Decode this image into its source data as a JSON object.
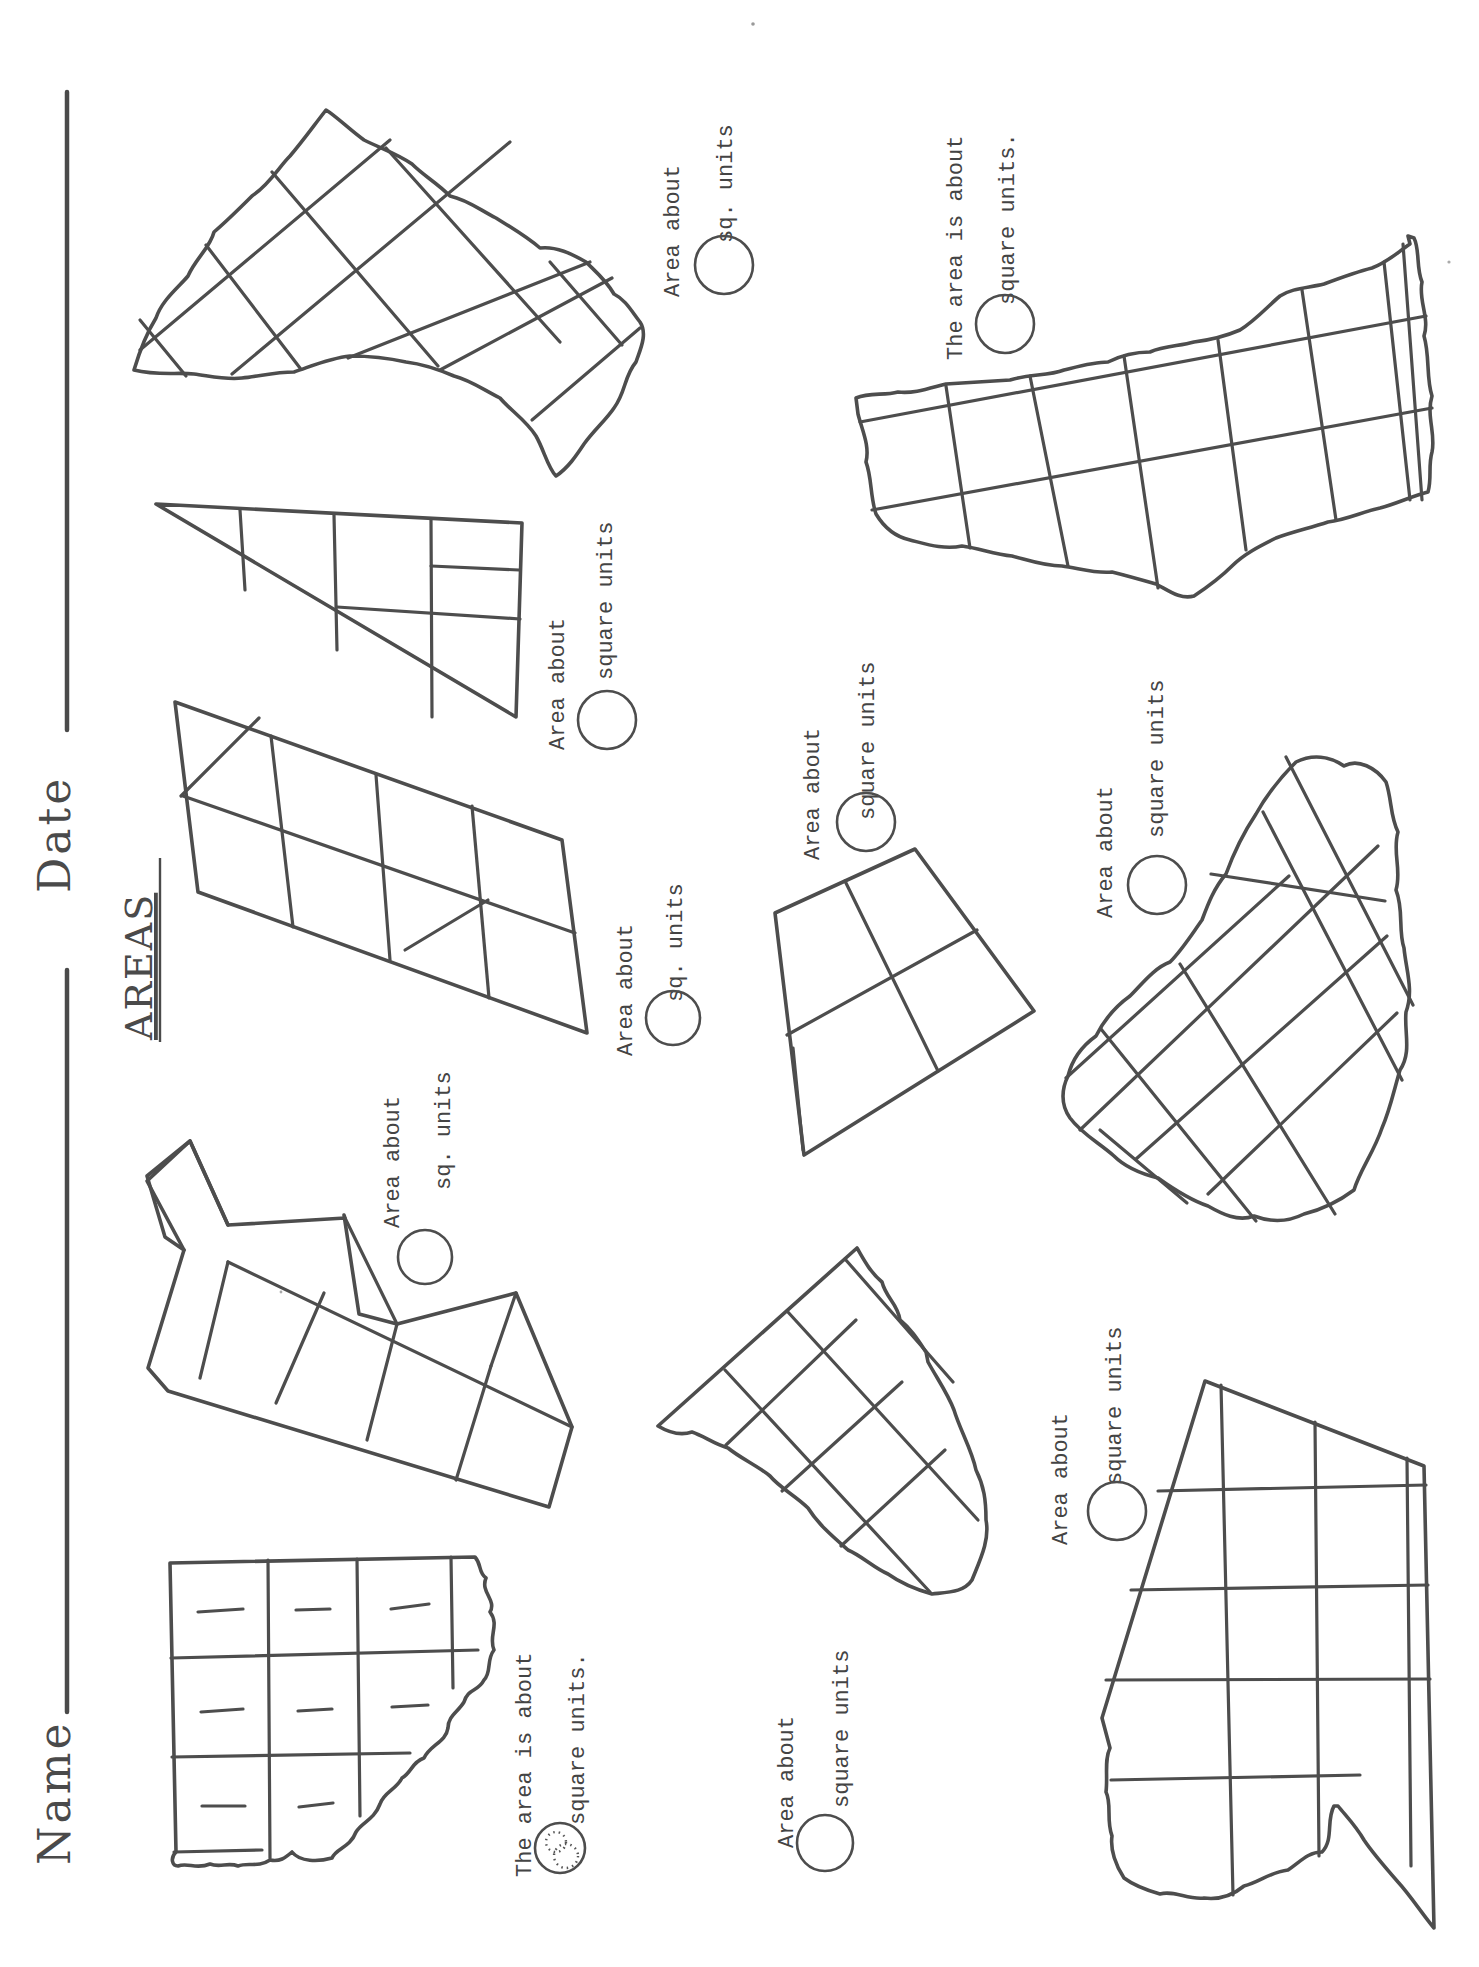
{
  "worksheet": {
    "title": "AREAS",
    "orientation": "rotated 90 degrees counter-clockwise",
    "header": {
      "name_label": "Name",
      "date_label": "Date"
    },
    "ink_color": "#4d4d4d",
    "paper_color": "#ffffff",
    "problems": [
      {
        "id": "example-torn-grid",
        "label_line1": "The area is about",
        "label_line2": "square units.",
        "answer": "8",
        "answer_style": "dotted-traced",
        "grid": "3x4 with torn edge, 8 tally-marked squares"
      },
      {
        "id": "zigzag-strip",
        "label_line1": "Area about",
        "label_line2": "sq. units",
        "answer": ""
      },
      {
        "id": "torn-pentagon",
        "label_line1": "Area about",
        "label_line2": "square units",
        "answer": ""
      },
      {
        "id": "trapezoid-with-notch",
        "label_line1": "Area about",
        "label_line2": "square units",
        "answer": ""
      },
      {
        "id": "parallelogram",
        "label_line1": "Area about",
        "label_line2": "sq. units",
        "answer": ""
      },
      {
        "id": "small-quad",
        "label_line1": "Area about",
        "label_line2": "square units",
        "answer": ""
      },
      {
        "id": "torn-blob-right",
        "label_line1": "Area about",
        "label_line2": "square units",
        "answer": ""
      },
      {
        "id": "right-triangle",
        "label_line1": "Area about",
        "label_line2": "square units",
        "answer": ""
      },
      {
        "id": "torn-triangle-top",
        "label_line1": "Area about",
        "label_line2": "sq. units",
        "answer": ""
      },
      {
        "id": "torn-rectangle-right",
        "label_line1": "The area is about",
        "label_line2": "square units.",
        "answer": ""
      }
    ]
  }
}
